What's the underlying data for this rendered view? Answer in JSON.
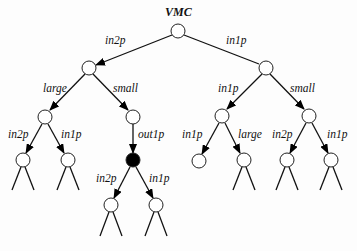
{
  "diagram": {
    "type": "tree",
    "root_label": "VMC",
    "nodes": [
      {
        "id": "n0",
        "x": 178,
        "y": 31,
        "filled": false,
        "subtree": false
      },
      {
        "id": "n1",
        "x": 89,
        "y": 68,
        "filled": false,
        "subtree": false
      },
      {
        "id": "n2",
        "x": 266,
        "y": 68,
        "filled": false,
        "subtree": false
      },
      {
        "id": "n3",
        "x": 45,
        "y": 117,
        "filled": false,
        "subtree": false
      },
      {
        "id": "n4",
        "x": 133,
        "y": 117,
        "filled": false,
        "subtree": false
      },
      {
        "id": "n5",
        "x": 222,
        "y": 116,
        "filled": false,
        "subtree": false
      },
      {
        "id": "n6",
        "x": 309,
        "y": 116,
        "filled": false,
        "subtree": false
      },
      {
        "id": "n7",
        "x": 23,
        "y": 160,
        "filled": false,
        "subtree": true
      },
      {
        "id": "n8",
        "x": 68,
        "y": 160,
        "filled": false,
        "subtree": true
      },
      {
        "id": "n9",
        "x": 133,
        "y": 160,
        "filled": true,
        "subtree": false
      },
      {
        "id": "n10",
        "x": 199,
        "y": 161,
        "filled": false,
        "subtree": false
      },
      {
        "id": "n11",
        "x": 244,
        "y": 160,
        "filled": false,
        "subtree": true
      },
      {
        "id": "n12",
        "x": 287,
        "y": 160,
        "filled": false,
        "subtree": true
      },
      {
        "id": "n13",
        "x": 331,
        "y": 160,
        "filled": false,
        "subtree": true
      },
      {
        "id": "n14",
        "x": 111,
        "y": 205,
        "filled": false,
        "subtree": true
      },
      {
        "id": "n15",
        "x": 156,
        "y": 205,
        "filled": false,
        "subtree": true
      }
    ],
    "edges": [
      {
        "from": "n0",
        "to": "n1",
        "label": "in2p",
        "arrow": true
      },
      {
        "from": "n0",
        "to": "n2",
        "label": "in1p",
        "arrow": false
      },
      {
        "from": "n1",
        "to": "n3",
        "label": "large",
        "arrow": true
      },
      {
        "from": "n1",
        "to": "n4",
        "label": "small",
        "arrow": true
      },
      {
        "from": "n2",
        "to": "n5",
        "label": "in1p",
        "arrow": true
      },
      {
        "from": "n2",
        "to": "n6",
        "label": "small",
        "arrow": true
      },
      {
        "from": "n3",
        "to": "n7",
        "label": "in2p",
        "arrow": true
      },
      {
        "from": "n3",
        "to": "n8",
        "label": "in1p",
        "arrow": true
      },
      {
        "from": "n4",
        "to": "n9",
        "label": "out1p",
        "arrow": true
      },
      {
        "from": "n5",
        "to": "n10",
        "label": "in1p",
        "arrow": true
      },
      {
        "from": "n5",
        "to": "n11",
        "label": "large",
        "arrow": true
      },
      {
        "from": "n6",
        "to": "n12",
        "label": "in2p",
        "arrow": true
      },
      {
        "from": "n6",
        "to": "n13",
        "label": "in1p",
        "arrow": true
      },
      {
        "from": "n9",
        "to": "n14",
        "label": "in2p",
        "arrow": true
      },
      {
        "from": "n9",
        "to": "n15",
        "label": "in1p",
        "arrow": true
      }
    ],
    "labels": {
      "root": "VMC",
      "e_n0_n1": "in2p",
      "e_n0_n2": "in1p",
      "e_n1_n3": "large",
      "e_n1_n4": "small",
      "e_n2_n5": "in1p",
      "e_n2_n6": "small",
      "e_n3_n7": "in2p",
      "e_n3_n8": "in1p",
      "e_n4_n9": "out1p",
      "e_n5_n10": "in1p",
      "e_n5_n11": "large",
      "e_n6_n12": "in2p",
      "e_n6_n13": "in1p",
      "e_n9_n14": "in2p",
      "e_n9_n15": "in1p"
    }
  }
}
